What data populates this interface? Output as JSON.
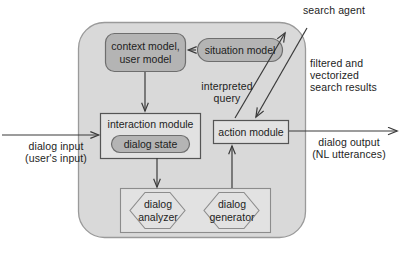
{
  "diagram": {
    "colors": {
      "outer_container_fill": "#d9d9d9",
      "outer_container_stroke": "#9a9a9a",
      "module_fill": "#e2e2e2",
      "module_stroke": "#6e6e6e",
      "rounded_node_fill": "#b4b4b4",
      "rounded_node_stroke": "#6e6e6e",
      "hexagon_fill": "#e2e2e2",
      "hexagon_stroke": "#8c8c8c",
      "arrow_color": "#3a3a3a",
      "text_color": "#1d1d1d",
      "page_background": "#ffffff"
    },
    "nodes": [
      {
        "id": "context-model",
        "label": "context model,\nuser model",
        "shape": "rounded-rect",
        "fill": "gray"
      },
      {
        "id": "situation-model",
        "label": "situation model",
        "shape": "pill",
        "fill": "gray"
      },
      {
        "id": "interaction-module",
        "label": "interaction module",
        "shape": "rect",
        "fill": "light"
      },
      {
        "id": "dialog-state",
        "label": "dialog state",
        "shape": "pill",
        "fill": "gray"
      },
      {
        "id": "action-module",
        "label": "action module",
        "shape": "rect",
        "fill": "light"
      },
      {
        "id": "dialog-analyzer",
        "label": "dialog\nanalyzer",
        "shape": "hexagon",
        "fill": "light"
      },
      {
        "id": "dialog-generator",
        "label": "dialog\ngenerator",
        "shape": "hexagon",
        "fill": "light"
      }
    ],
    "edge_labels": [
      {
        "id": "dialog-input",
        "text": "dialog input\n(user's input)"
      },
      {
        "id": "dialog-output",
        "text": "dialog output\n(NL utterances)"
      },
      {
        "id": "interpreted-query",
        "text": "interpreted\nquery"
      },
      {
        "id": "search-agent",
        "text": "search agent"
      },
      {
        "id": "search-results",
        "text": "filtered and\nvectorized\nsearch results"
      }
    ]
  },
  "labels": {
    "context_model": "context model,\nuser model",
    "situation_model": "situation model",
    "interaction_module": "interaction module",
    "dialog_state": "dialog state",
    "action_module": "action module",
    "dialog_analyzer": "dialog\nanalyzer",
    "dialog_generator": "dialog\ngenerator",
    "dialog_input": "dialog input\n(user's input)",
    "dialog_output": "dialog output\n(NL utterances)",
    "interpreted_query": "interpreted\nquery",
    "search_agent": "search agent",
    "search_results": "filtered and\nvectorized\nsearch results"
  }
}
